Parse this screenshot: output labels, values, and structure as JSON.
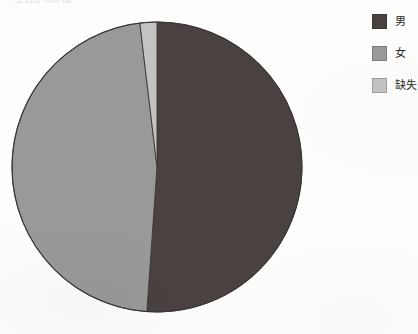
{
  "page": {
    "background_color": "#fdfdfc",
    "width": 418,
    "height": 334
  },
  "title": {
    "text": "性别分布饼图",
    "visible_partially": true
  },
  "legend": {
    "position": "right",
    "items": [
      {
        "label": "男",
        "color": "#4a4241"
      },
      {
        "label": "女",
        "color": "#999999"
      },
      {
        "label": "缺失",
        "color": "#c3c3c3"
      }
    ]
  },
  "chart_data": {
    "type": "pie",
    "title": "性别分布饼图",
    "xlabel": "",
    "ylabel": "",
    "legend_position": "right",
    "grid": false,
    "start_angle_deg": 0,
    "direction": "clockwise",
    "categories": [
      "男",
      "女",
      "缺失"
    ],
    "values": [
      51.1,
      47.0,
      1.9
    ],
    "colors": [
      "#4a4241",
      "#999999",
      "#c3c3c3"
    ],
    "slices": [
      {
        "label": "男",
        "value": 51.1,
        "color": "#4a4241",
        "start_deg": 0.0,
        "end_deg": 184.0
      },
      {
        "label": "女",
        "value": 47.0,
        "color": "#999999",
        "start_deg": 184.0,
        "end_deg": 353.2
      },
      {
        "label": "缺失",
        "value": 1.9,
        "color": "#c3c3c3",
        "start_deg": 353.2,
        "end_deg": 360.0
      }
    ],
    "geometry": {
      "center_x": 157,
      "center_y": 167,
      "radius": 145,
      "outline_color": "#3a3634"
    }
  }
}
